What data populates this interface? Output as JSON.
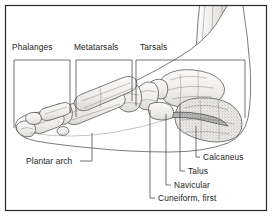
{
  "figure": {
    "view": "medial-lateral side view with tibia and fibula entering from above",
    "background_color": "#ffffff",
    "ink_color": "#1d1d1d",
    "bone_fill_color": "#f2f1ef",
    "outline_color": "#59595c"
  },
  "frame": {
    "name": "figure-border",
    "stroke_color": "#2a2a2a"
  },
  "bracket_labels": [
    {
      "id": "phalanges",
      "text": "Phalanges",
      "x": 12,
      "y": 50
    },
    {
      "id": "metatarsals",
      "text": "Metatarsals",
      "x": 74,
      "y": 50
    },
    {
      "id": "tarsals",
      "text": "Tarsals",
      "x": 140,
      "y": 50
    }
  ],
  "leader_labels": [
    {
      "id": "plantar-arch",
      "text": "Plantar arch",
      "x": 26,
      "y": 162,
      "anchor": "start"
    },
    {
      "id": "calcaneus",
      "text": "Calcaneus",
      "x": 200,
      "y": 160,
      "anchor": "start"
    },
    {
      "id": "talus",
      "text": "Talus",
      "x": 186,
      "y": 174,
      "anchor": "start"
    },
    {
      "id": "navicular",
      "text": "Navicular",
      "x": 172,
      "y": 188,
      "anchor": "start"
    },
    {
      "id": "cuneiform-first",
      "text": "Cuneiform, first",
      "x": 156,
      "y": 201,
      "anchor": "start"
    }
  ],
  "bone_groups": [
    {
      "id": "tibia-fibula",
      "label": "Tibia and fibula shaft"
    },
    {
      "id": "talus",
      "label": "Talus"
    },
    {
      "id": "calcaneus",
      "label": "Calcaneus"
    },
    {
      "id": "navicular",
      "label": "Navicular"
    },
    {
      "id": "cuneiforms",
      "label": "Cuneiform bones"
    },
    {
      "id": "metatarsals",
      "label": "Metatarsal bones"
    },
    {
      "id": "phalanges",
      "label": "Phalanges"
    },
    {
      "id": "sesamoid",
      "label": "Sesamoid bone"
    }
  ]
}
